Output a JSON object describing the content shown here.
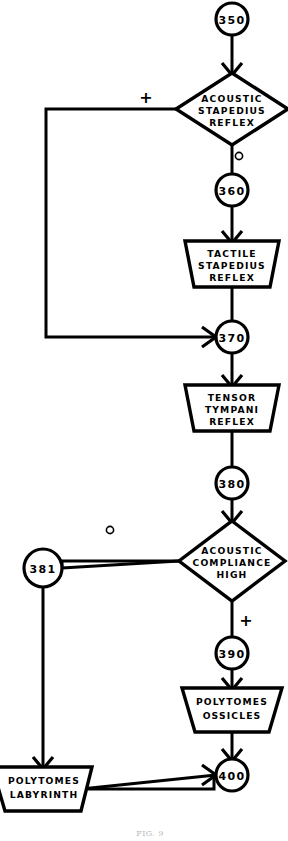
{
  "figure": {
    "caption": "FIG. 9",
    "stroke_color": "#000000",
    "background_color": "#ffffff"
  },
  "nodes": [
    {
      "id": "n350",
      "label": "350",
      "type": "connector",
      "cx": 232,
      "cy": 19,
      "r": 16
    },
    {
      "id": "n360",
      "label": "360",
      "type": "connector",
      "cx": 232,
      "cy": 190,
      "r": 16
    },
    {
      "id": "n370",
      "label": "370",
      "type": "connector",
      "cx": 232,
      "cy": 337,
      "r": 16
    },
    {
      "id": "n380",
      "label": "380",
      "type": "connector",
      "cx": 232,
      "cy": 483,
      "r": 16
    },
    {
      "id": "n381",
      "label": "381",
      "type": "connector",
      "cx": 43,
      "cy": 568,
      "r": 19
    },
    {
      "id": "n390",
      "label": "390",
      "type": "connector",
      "cx": 232,
      "cy": 653,
      "r": 16
    },
    {
      "id": "n400",
      "label": "400",
      "type": "connector",
      "cx": 232,
      "cy": 775,
      "r": 16
    }
  ],
  "decisions": [
    {
      "id": "d-acoustic-stapedius",
      "type": "decision",
      "lines": [
        "ACOUSTIC",
        "STAPEDIUS",
        "REFLEX"
      ],
      "cx": 232,
      "cy": 109,
      "rx": 56,
      "ry": 36
    },
    {
      "id": "d-acoustic-compliance",
      "type": "decision",
      "lines": [
        "ACOUSTIC",
        "COMPLIANCE",
        "HIGH"
      ],
      "cx": 232,
      "cy": 561,
      "rx": 53,
      "ry": 40
    }
  ],
  "processes": [
    {
      "id": "p-tactile-stapedius",
      "type": "trapezoid",
      "lines": [
        "TACTILE",
        "STAPEDIUS",
        "REFLEX"
      ],
      "cx": 232,
      "cy": 264,
      "top_w": 94,
      "bottom_w": 76,
      "h": 46
    },
    {
      "id": "p-tensor-tympani",
      "type": "trapezoid",
      "lines": [
        "TENSOR",
        "TYMPANI",
        "REFLEX"
      ],
      "cx": 232,
      "cy": 408,
      "top_w": 94,
      "bottom_w": 76,
      "h": 46
    },
    {
      "id": "p-polytomes-ossicles",
      "type": "trapezoid",
      "lines": [
        "POLYTOMES",
        "OSSICLES"
      ],
      "cx": 232,
      "cy": 710,
      "top_w": 100,
      "bottom_w": 74,
      "h": 44
    },
    {
      "id": "p-polytomes-labyrinth",
      "type": "trapezoid",
      "lines": [
        "POLYTOMES",
        "LABYRINTH"
      ],
      "cx": 44,
      "cy": 789,
      "top_w": 100,
      "bottom_w": 74,
      "h": 44
    }
  ],
  "branch_marks": [
    {
      "id": "mark-stapedius-positive",
      "glyph": "+",
      "kind": "plus",
      "x": 146,
      "y": 97
    },
    {
      "id": "mark-stapedius-negative",
      "glyph": "o",
      "kind": "circle",
      "x": 239,
      "y": 156
    },
    {
      "id": "mark-compliance-negative",
      "glyph": "o",
      "kind": "circle",
      "x": 110,
      "y": 530
    },
    {
      "id": "mark-compliance-positive",
      "glyph": "+",
      "kind": "plus",
      "x": 246,
      "y": 620
    }
  ],
  "edges": [
    {
      "id": "e-350-to-stapedius",
      "from": "n350",
      "to": "d-acoustic-stapedius",
      "arrow": true
    },
    {
      "id": "e-stapedius-no-to-360",
      "from": "d-acoustic-stapedius",
      "to": "n360",
      "arrow": false
    },
    {
      "id": "e-360-to-tactile",
      "from": "n360",
      "to": "p-tactile-stapedius",
      "arrow": true
    },
    {
      "id": "e-tactile-to-370",
      "from": "p-tactile-stapedius",
      "to": "n370",
      "arrow": false
    },
    {
      "id": "e-stapedius-yes-to-370",
      "from": "d-acoustic-stapedius",
      "to": "n370",
      "arrow": true
    },
    {
      "id": "e-370-to-tensor",
      "from": "n370",
      "to": "p-tensor-tympani",
      "arrow": true
    },
    {
      "id": "e-tensor-to-380",
      "from": "p-tensor-tympani",
      "to": "n380",
      "arrow": false
    },
    {
      "id": "e-380-to-compliance",
      "from": "n380",
      "to": "d-acoustic-compliance",
      "arrow": true
    },
    {
      "id": "e-compliance-no-to-381",
      "from": "d-acoustic-compliance",
      "to": "n381",
      "arrow": false
    },
    {
      "id": "e-compliance-yes-to-390",
      "from": "d-acoustic-compliance",
      "to": "n390",
      "arrow": false
    },
    {
      "id": "e-390-to-ossicles",
      "from": "n390",
      "to": "p-polytomes-ossicles",
      "arrow": true
    },
    {
      "id": "e-381-to-labyrinth",
      "from": "n381",
      "to": "p-polytomes-labyrinth",
      "arrow": true
    },
    {
      "id": "e-ossicles-to-400",
      "from": "p-polytomes-ossicles",
      "to": "n400",
      "arrow": true
    },
    {
      "id": "e-labyrinth-to-400",
      "from": "p-polytomes-labyrinth",
      "to": "n400",
      "arrow": true
    }
  ]
}
